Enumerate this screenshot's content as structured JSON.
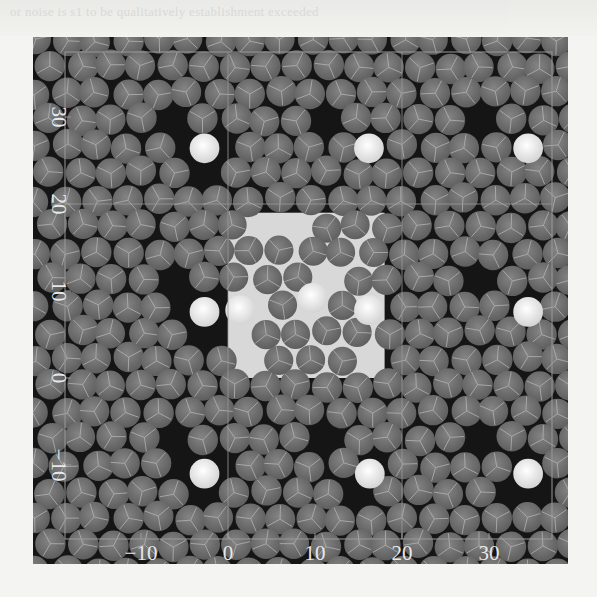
{
  "figure": {
    "type": "particle-snapshot",
    "background_color": "#151515",
    "frame_color": "#9a9a9a",
    "particle_color": "#6e6e6e",
    "particle_highlight_color": "#8a8a8a",
    "bright_particle_color": "#f2f2f2",
    "central_region_color": "#d8d8d8"
  },
  "chart_data": {
    "type": "scatter",
    "title": "",
    "xlabel": "",
    "ylabel": "",
    "xlim": [
      -17,
      37
    ],
    "ylim": [
      -17,
      36
    ],
    "x_ticks": [
      -10,
      0,
      10,
      20,
      30
    ],
    "y_ticks": [
      -10,
      0,
      10,
      20,
      30
    ],
    "x_tick_labels": [
      "−10",
      "0",
      "10",
      "20",
      "30"
    ],
    "y_tick_labels": [
      "−10",
      "0",
      "10",
      "20",
      "30"
    ],
    "grid_lines_x": [
      0,
      20
    ],
    "grid_lines_y": [
      20
    ],
    "grid": true,
    "legend": null,
    "particle_diameter": 3.6,
    "particle_count_approx": 640,
    "bright_particles": [
      {
        "x": -2.7,
        "y": 26.4
      },
      {
        "x": 16.2,
        "y": 26.4
      },
      {
        "x": 34.5,
        "y": 26.4
      },
      {
        "x": -2.7,
        "y": 7.6
      },
      {
        "x": 1.4,
        "y": 7.8
      },
      {
        "x": 9.7,
        "y": 9.2
      },
      {
        "x": 16.2,
        "y": 7.8
      },
      {
        "x": 34.5,
        "y": 7.6
      },
      {
        "x": -2.7,
        "y": -11.0
      },
      {
        "x": 16.3,
        "y": -11.0
      },
      {
        "x": 34.5,
        "y": -11.0
      }
    ],
    "void_centers": [
      {
        "x": -7,
        "y": 30
      },
      {
        "x": 11,
        "y": 30
      },
      {
        "x": 30,
        "y": 30
      },
      {
        "x": -7,
        "y": 11
      },
      {
        "x": 30,
        "y": 11
      },
      {
        "x": -7,
        "y": -7
      },
      {
        "x": 11,
        "y": -7
      },
      {
        "x": 30,
        "y": -7
      }
    ],
    "disordered_region": {
      "x": [
        0,
        18
      ],
      "y": [
        0,
        19
      ]
    }
  },
  "bleed_text": {
    "line1": "or noise is s1 to be qualitatively establishment exceeded",
    "line2": "…"
  }
}
